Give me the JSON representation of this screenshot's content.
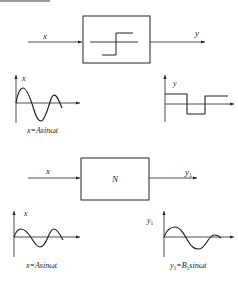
{
  "top_block": {
    "input_label": "x",
    "output_label": "y",
    "block_type": "relay-nonlinearity",
    "input_plot": {
      "axis_label": "x",
      "caption": "x=Asinωt"
    },
    "output_plot": {
      "axis_label": "y"
    }
  },
  "bottom_block": {
    "input_label": "x",
    "block_label": "N",
    "output_label": "y",
    "output_subscript": "1",
    "input_plot": {
      "axis_label": "x",
      "caption": "x=Asinωt"
    },
    "output_plot": {
      "axis_label": "y",
      "axis_subscript": "1",
      "caption_prefix": "y",
      "caption_sub1": "1",
      "caption_mid": "=B",
      "caption_sub2": "1",
      "caption_suffix": "sinωt"
    }
  },
  "colors": {
    "line": "#222222",
    "background": "#ffffff",
    "topbar": "#9a9a9a"
  }
}
